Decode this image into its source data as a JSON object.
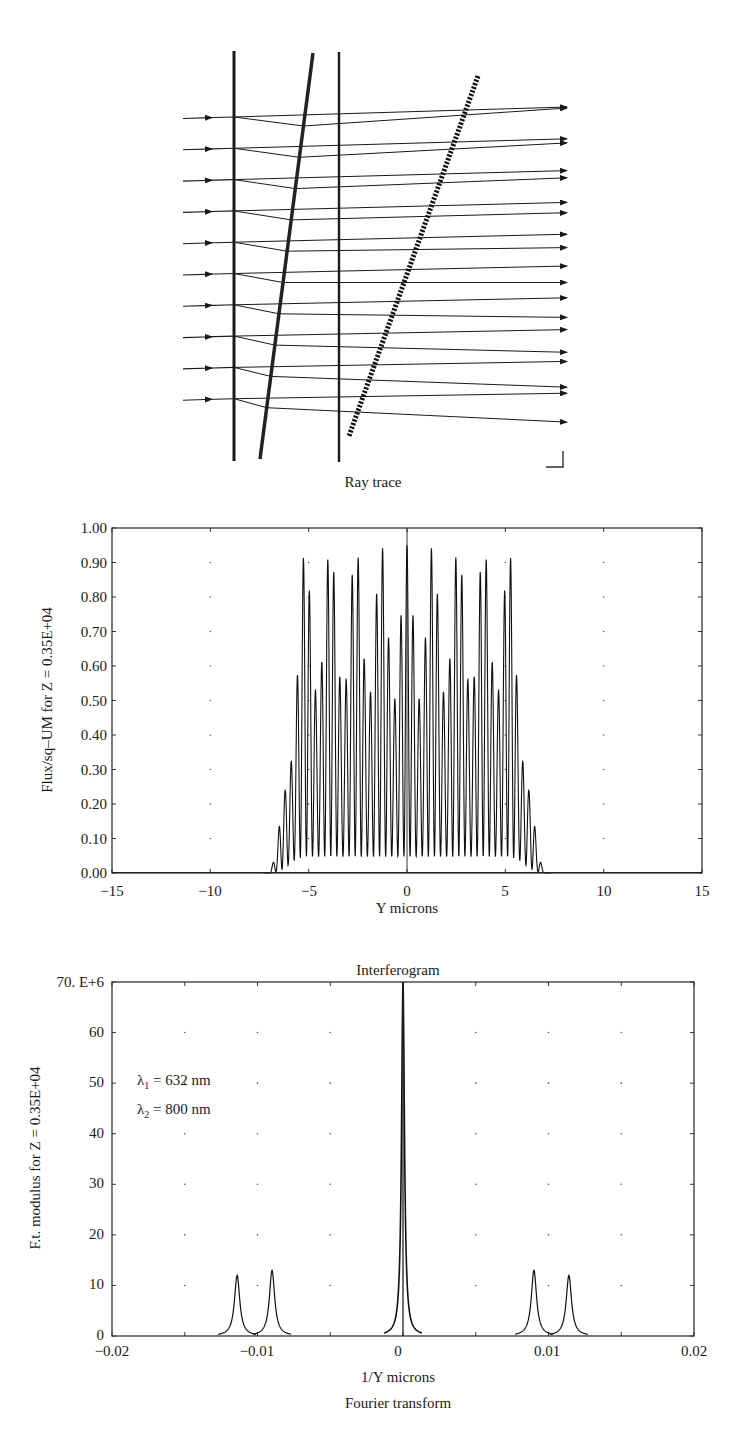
{
  "figure": {
    "panels": [
      "Ray trace",
      "Flux profile",
      "Fourier transform"
    ]
  },
  "ray_trace": {
    "caption": "Ray trace",
    "ray_count": 10,
    "elements": [
      {
        "name": "vertical-plate-1",
        "type": "solid-line"
      },
      {
        "name": "tilted-wedge",
        "type": "thick-solid-line"
      },
      {
        "name": "vertical-plate-2",
        "type": "solid-line"
      },
      {
        "name": "detector-plane",
        "type": "dashed-thick-line"
      }
    ]
  },
  "chart_data": [
    {
      "type": "line",
      "title": "",
      "xlabel": "Y microns",
      "ylabel": "Flux/sq–UM for Z = 0.35E+04",
      "xlim": [
        -15,
        15
      ],
      "ylim": [
        0.0,
        1.0
      ],
      "x_ticks": [
        "−15",
        "−10",
        "−5",
        "0",
        "5",
        "10",
        "15"
      ],
      "y_ticks": [
        "0.00",
        "0.10",
        "0.20",
        "0.30",
        "0.40",
        "0.50",
        "0.60",
        "0.70",
        "0.80",
        "0.90",
        "1.00"
      ],
      "grid": "dotted points at major ticks",
      "description": "Dense fringe pattern between about Y=-7 and Y=7; fringe peaks near 0.90-0.96, troughs near 0.00-0.05, envelope center about 0.5; edges taper to 0 at +/-7",
      "series": [
        {
          "name": "flux",
          "envelope_x": [
            -15,
            -7.2,
            -6.8,
            -6.4,
            -6.0,
            -5.6,
            -5.2,
            5.2,
            5.6,
            5.9,
            6.2,
            6.6,
            7.0,
            15
          ],
          "envelope_max": [
            0.0,
            0.0,
            0.03,
            0.13,
            0.4,
            0.72,
            0.94,
            0.95,
            0.8,
            0.6,
            0.3,
            0.08,
            0.0,
            0.0
          ],
          "envelope_min": [
            0.0,
            0.0,
            0.0,
            0.0,
            0.0,
            0.0,
            0.0,
            0.0,
            0.0,
            0.0,
            0.0,
            0.0,
            0.0,
            0.0
          ],
          "fringe_count_approx": 44
        }
      ]
    },
    {
      "type": "line",
      "title": "Interferogram",
      "xlabel": "1/Y microns",
      "ylabel": "F.t. modulus for Z = 0.35E+04",
      "caption": "Fourier transform",
      "xlim": [
        -0.02,
        0.02
      ],
      "ylim": [
        0,
        70
      ],
      "y_scale_label": "70. E+6",
      "x_ticks": [
        "−0.02",
        "−0.01",
        "0",
        "0.01",
        "0.02"
      ],
      "y_ticks": [
        "0",
        "10",
        "20",
        "30",
        "40",
        "50",
        "60",
        "70. E+6"
      ],
      "grid": "dotted points at major ticks",
      "annotations": [
        "λ1 = 632 nm",
        "λ2 = 800 nm"
      ],
      "series": [
        {
          "name": "F.t. modulus",
          "peaks": [
            {
              "x": -0.0114,
              "y": 12
            },
            {
              "x": -0.009,
              "y": 13
            },
            {
              "x": 0.0,
              "y": 70
            },
            {
              "x": 0.009,
              "y": 13
            },
            {
              "x": 0.0114,
              "y": 12
            }
          ]
        }
      ]
    }
  ],
  "labels": {
    "chart1": {
      "ylabel": "Flux/sq–UM for Z = 0.35E+04",
      "xlabel": "Y microns",
      "x_ticks": [
        "−15",
        "−10",
        "−5",
        "0",
        "5",
        "10",
        "15"
      ],
      "y_ticks": [
        "0.00",
        "0.10",
        "0.20",
        "0.30",
        "0.40",
        "0.50",
        "0.60",
        "0.70",
        "0.80",
        "0.90",
        "1.00"
      ]
    },
    "chart2": {
      "title": "Interferogram",
      "ylabel": "F.t. modulus for Z = 0.35E+04",
      "xlabel": "1/Y microns",
      "caption": "Fourier transform",
      "x_ticks": [
        "−0.02",
        "−0.01",
        "0",
        "0.01",
        "0.02"
      ],
      "y_ticks": [
        "0",
        "10",
        "20",
        "30",
        "40",
        "50",
        "60",
        "70. E+6"
      ],
      "lambda1_prefix": "λ",
      "lambda1_sub": "1",
      "lambda1_value": " = 632 nm",
      "lambda2_prefix": "λ",
      "lambda2_sub": "2",
      "lambda2_value": " = 800 nm"
    }
  }
}
